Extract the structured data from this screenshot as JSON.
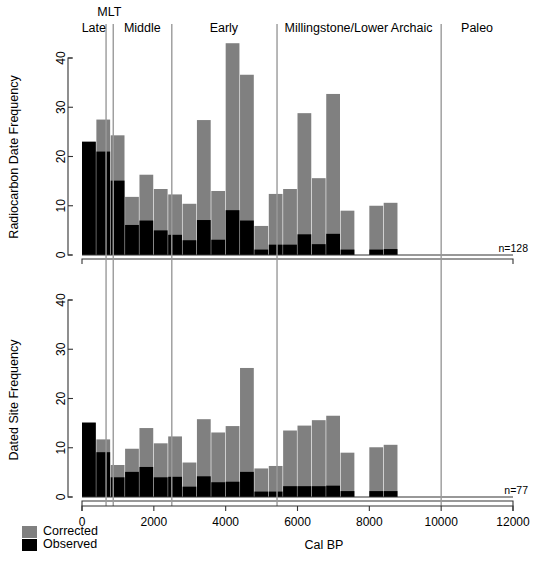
{
  "figure": {
    "xlabel": "Cal BP",
    "sample_size_top": "n=128",
    "sample_size_bottom": "n=77"
  },
  "legend": {
    "position": "bottom-left",
    "entries": [
      {
        "label": "Corrected",
        "color": "#808080"
      },
      {
        "label": "Observed",
        "color": "#000000"
      }
    ]
  },
  "periods": {
    "labels": [
      {
        "name": "Late",
        "text": "Late",
        "center_calbp": 330
      },
      {
        "name": "MLT",
        "text": "MLT",
        "center_calbp": 760
      },
      {
        "name": "Middle",
        "text": "Middle",
        "center_calbp": 1680
      },
      {
        "name": "Early",
        "text": "Early",
        "center_calbp": 3950
      },
      {
        "name": "Millingstone/Lower Archaic",
        "text": "Millingstone/Lower Archaic",
        "center_calbp": 7700
      },
      {
        "name": "Paleo",
        "text": "Paleo",
        "center_calbp": 11000
      }
    ],
    "boundaries_calbp": [
      670,
      870,
      2500,
      5430,
      10000
    ]
  },
  "chart_data": [
    {
      "type": "bar",
      "name": "radiocarbon-date-frequency",
      "title": "",
      "xlabel": "Cal BP",
      "ylabel": "Radiocarbon Date Frequency",
      "xlim": [
        0,
        12000
      ],
      "ylim": [
        0,
        44
      ],
      "yticks": [
        0,
        10,
        20,
        30,
        40
      ],
      "xticks": [
        0,
        2000,
        4000,
        6000,
        8000,
        10000,
        12000
      ],
      "grid": false,
      "stacked": true,
      "bin_width": 400,
      "bin_starts": [
        0,
        400,
        800,
        1200,
        1600,
        2000,
        2400,
        2800,
        3200,
        3600,
        4000,
        4400,
        4800,
        5200,
        5600,
        6000,
        6400,
        6800,
        7200,
        7600,
        8000,
        8400,
        8800,
        9200,
        9600,
        10000,
        10400
      ],
      "series": [
        {
          "name": "Corrected",
          "color": "#808080",
          "values": [
            23,
            27.5,
            24.3,
            11.8,
            16.3,
            13.4,
            12.3,
            10.4,
            27.4,
            13,
            43,
            36.6,
            5.9,
            12.4,
            13.4,
            28.8,
            15.6,
            32.7,
            9,
            0,
            10,
            10.6,
            0,
            0,
            0,
            0,
            0
          ]
        },
        {
          "name": "Observed",
          "color": "#000000",
          "values": [
            23,
            21,
            15.1,
            6.1,
            7,
            5,
            4.1,
            3,
            7.1,
            3.1,
            9.1,
            7,
            1.1,
            2.1,
            2.1,
            4.2,
            2.2,
            4.3,
            1.1,
            0,
            1.1,
            1.2,
            0,
            0,
            0,
            0,
            0
          ]
        }
      ]
    },
    {
      "type": "bar",
      "name": "dated-site-frequency",
      "title": "",
      "xlabel": "Cal BP",
      "ylabel": "Dated Site Frequency",
      "xlim": [
        0,
        12000
      ],
      "ylim": [
        0,
        44
      ],
      "yticks": [
        0,
        10,
        20,
        30,
        40
      ],
      "xticks": [
        0,
        2000,
        4000,
        6000,
        8000,
        10000,
        12000
      ],
      "grid": false,
      "stacked": true,
      "bin_width": 400,
      "bin_starts": [
        0,
        400,
        800,
        1200,
        1600,
        2000,
        2400,
        2800,
        3200,
        3600,
        4000,
        4400,
        4800,
        5200,
        5600,
        6000,
        6400,
        6800,
        7200,
        7600,
        8000,
        8400,
        8800,
        9200,
        9600,
        10000,
        10400
      ],
      "series": [
        {
          "name": "Corrected",
          "color": "#808080",
          "values": [
            15.1,
            11.7,
            6.5,
            9.8,
            14,
            10.9,
            12.3,
            7,
            15.8,
            13.1,
            14.4,
            26.2,
            5.8,
            6.3,
            13.5,
            14.5,
            15.6,
            16.5,
            9,
            0,
            10.1,
            10.6,
            0,
            0,
            0,
            0,
            0
          ]
        },
        {
          "name": "Observed",
          "color": "#000000",
          "values": [
            15.1,
            9.1,
            4,
            5.1,
            6.1,
            4,
            4.1,
            2.1,
            4.2,
            3,
            3.1,
            5.1,
            1.1,
            1.1,
            2.2,
            2.2,
            2.2,
            2.3,
            1.2,
            0,
            1.2,
            1.2,
            0,
            0,
            0,
            0,
            0
          ]
        }
      ]
    }
  ]
}
